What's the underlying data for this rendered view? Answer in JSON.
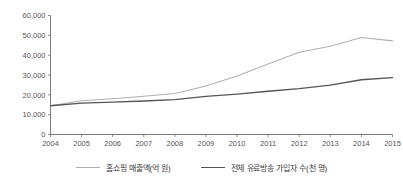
{
  "chart_data": {
    "type": "line",
    "title": "",
    "subtitle": "",
    "xlabel": "",
    "ylabel": "",
    "grid": false,
    "legend_position": "bottom",
    "categories": [
      "2004",
      "2005",
      "2006",
      "2007",
      "2008",
      "2009",
      "2010",
      "2011",
      "2012",
      "2013",
      "2014",
      "2015"
    ],
    "x": [
      2004,
      2005,
      2006,
      2007,
      2008,
      2009,
      2010,
      2011,
      2012,
      2013,
      2014,
      2015
    ],
    "xlim": [
      2004,
      2015
    ],
    "ylim": [
      0,
      60000
    ],
    "yticks": [
      0,
      10000,
      20000,
      30000,
      40000,
      50000,
      60000
    ],
    "ytick_labels": [
      "0",
      "10,000",
      "20,000",
      "30,000",
      "40,000",
      "50,000",
      "60,000"
    ],
    "xtick_labels": [
      "2004",
      "2005",
      "2006",
      "2007",
      "2008",
      "2009",
      "2010",
      "2011",
      "2012",
      "2013",
      "2014",
      "2015"
    ],
    "series": [
      {
        "name": "홈쇼핑 매출액(억 원)",
        "color": "#b0b0b0",
        "values": [
          14500,
          17000,
          18000,
          19300,
          20700,
          24500,
          29500,
          35500,
          41500,
          44500,
          48900,
          47200
        ]
      },
      {
        "name": "전체 유료방송 가입자 수(천 명)",
        "color": "#555555",
        "values": [
          14500,
          15800,
          16300,
          16900,
          17600,
          19200,
          20400,
          21800,
          23100,
          24900,
          27600,
          28700
        ]
      }
    ]
  },
  "legend": {
    "entries": [
      {
        "label": "홈쇼핑 매출액(억 원)",
        "swatch": "light-line-swatch"
      },
      {
        "label": "전체 유료방송 가입자 수(천 명)",
        "swatch": "dark-line-swatch"
      }
    ]
  }
}
